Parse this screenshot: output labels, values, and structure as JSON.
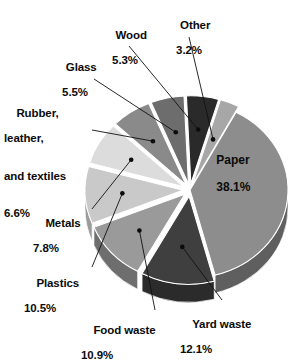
{
  "chart_data": {
    "type": "pie",
    "title": "",
    "subtitle": "",
    "xlabel": "",
    "ylabel": "",
    "units": "percent",
    "legend_position": "none",
    "grid": false,
    "labels_style": "callout-leader-lines",
    "total": 99.9,
    "categories": [
      "Paper",
      "Yard waste",
      "Food waste",
      "Plastics",
      "Metals",
      "Rubber, leather, and textiles",
      "Glass",
      "Wood",
      "Other"
    ],
    "values": [
      38.1,
      12.1,
      10.9,
      10.5,
      7.8,
      6.6,
      5.5,
      5.3,
      3.2
    ],
    "slices": [
      {
        "name": "Paper",
        "value": 38.1,
        "value_text": "38.1%",
        "color": "#8d8d8d",
        "side_color": "#5f5f5f",
        "label_placement": "inside"
      },
      {
        "name": "Yard waste",
        "value": 12.1,
        "value_text": "12.1%",
        "color": "#3f3f3f",
        "side_color": "#2b2b2b",
        "label_placement": "bottom-right"
      },
      {
        "name": "Food waste",
        "value": 10.9,
        "value_text": "10.9%",
        "color": "#9a9a9a",
        "side_color": "#6e6e6e",
        "label_placement": "bottom"
      },
      {
        "name": "Plastics",
        "value": 10.5,
        "value_text": "10.5%",
        "color": "#c9c9c9",
        "side_color": "#9b9b9b",
        "label_placement": "bottom-left"
      },
      {
        "name": "Metals",
        "value": 7.8,
        "value_text": "7.8%",
        "color": "#dcdcdc",
        "side_color": "#aeaeae",
        "label_placement": "left"
      },
      {
        "name": "Rubber, leather, and textiles",
        "value": 6.6,
        "value_text": "6.6%",
        "color": "#8a8a8a",
        "side_color": "#616161",
        "label_placement": "upper-left"
      },
      {
        "name": "Glass",
        "value": 5.5,
        "value_text": "5.5%",
        "color": "#6d6d6d",
        "side_color": "#4a4a4a",
        "label_placement": "upper-left-2"
      },
      {
        "name": "Wood",
        "value": 5.3,
        "value_text": "5.3%",
        "color": "#2a2a2a",
        "side_color": "#1a1a1a",
        "label_placement": "top"
      },
      {
        "name": "Other",
        "value": 3.2,
        "value_text": "3.2%",
        "color": "#a7a7a7",
        "side_color": "#7a7a7a",
        "label_placement": "top-right"
      }
    ]
  },
  "labels": {
    "wood": {
      "name": "Wood",
      "pct": "5.3%"
    },
    "other": {
      "name": "Other",
      "pct": "3.2%"
    },
    "glass": {
      "name": "Glass",
      "pct": "5.5%"
    },
    "rubber": {
      "line1": "Rubber,",
      "line2": "leather,",
      "line3": "and textiles",
      "pct": "6.6%"
    },
    "metals": {
      "name": "Metals",
      "pct": "7.8%"
    },
    "plastics": {
      "name": "Plastics",
      "pct": "10.5%"
    },
    "food": {
      "name": "Food waste",
      "pct": "10.9%"
    },
    "yard": {
      "name": "Yard waste",
      "pct": "12.1%"
    },
    "paper": {
      "name": "Paper",
      "pct": "38.1%"
    }
  }
}
